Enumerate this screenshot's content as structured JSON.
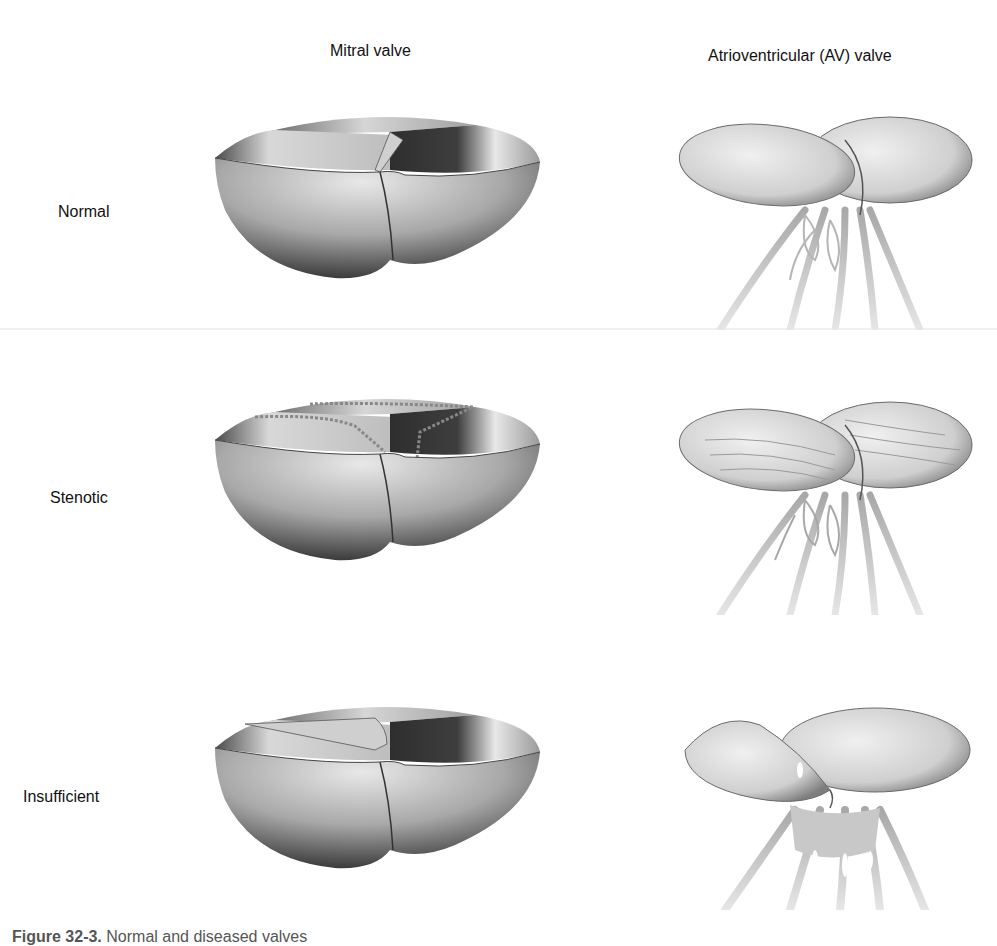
{
  "figure": {
    "columns": [
      {
        "title": "Mitral valve"
      },
      {
        "title": "Atrioventricular (AV) valve"
      }
    ],
    "rows": [
      {
        "label": "Normal"
      },
      {
        "label": "Stenotic"
      },
      {
        "label": "Insufficient"
      }
    ],
    "caption": {
      "prefix": "Figure 32-3.",
      "text": "Normal and diseased valves"
    },
    "colors": {
      "shade_dark": "#3a3a3a",
      "shade_mid": "#8a8a8a",
      "shade_light": "#e4e4e4",
      "chordae": "#bdbdbd",
      "background": "#ffffff"
    }
  }
}
